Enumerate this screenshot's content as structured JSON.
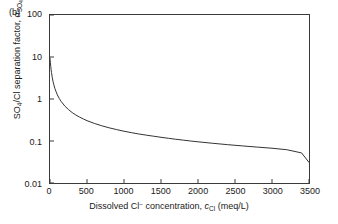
{
  "figure": {
    "panel_label": "(b)",
    "line_color": "#333333",
    "axis_color": "#3a3a3a",
    "background_color": "#ffffff"
  },
  "axis_titles": {
    "y_prefix": "SO",
    "y_sub1": "4",
    "y_mid": "/Cl separation factor, ",
    "y_alpha": "α",
    "y_alpha_sub": "SO4/Cl",
    "x_prefix": "Dissolved Cl",
    "x_sup": "−",
    "x_mid": " concentration, ",
    "x_c": "c",
    "x_c_sub": "Cl",
    "x_units": " (meq/L)"
  },
  "chart_data": {
    "type": "line",
    "title": "",
    "subtitle": "",
    "xlabel": "Dissolved Cl− concentration, cCl (meq/L)",
    "ylabel": "SO4/Cl separation factor, αSO4/Cl",
    "xlim": [
      0,
      3500
    ],
    "ylim": [
      0.01,
      100
    ],
    "yscale": "log",
    "xscale": "linear",
    "grid": false,
    "legend": null,
    "xticks": [
      0,
      500,
      1000,
      1500,
      2000,
      2500,
      3000,
      3500
    ],
    "xticklabels": [
      "0",
      "500",
      "1000",
      "1500",
      "2000",
      "2500",
      "3000",
      "3500"
    ],
    "yticks": [
      0.01,
      0.1,
      1,
      10,
      100
    ],
    "yticklabels": [
      "0.01",
      "0.1",
      "1",
      "10",
      "100"
    ],
    "series": [
      {
        "name": "SO4/Cl separation factor",
        "x": [
          0,
          2,
          5,
          10,
          15,
          20,
          30,
          40,
          50,
          65,
          80,
          100,
          125,
          150,
          200,
          250,
          300,
          350,
          400,
          450,
          500,
          600,
          700,
          800,
          900,
          1000,
          1100,
          1200,
          1300,
          1400,
          1500,
          1600,
          1700,
          1800,
          1900,
          2000,
          2200,
          2400,
          2600,
          2800,
          3000,
          3200,
          3400,
          3500
        ],
        "y": [
          9.5,
          8.6,
          7.4,
          6.0,
          5.0,
          4.3,
          3.3,
          2.65,
          2.25,
          1.8,
          1.52,
          1.25,
          1.03,
          0.88,
          0.68,
          0.56,
          0.475,
          0.415,
          0.37,
          0.335,
          0.305,
          0.262,
          0.23,
          0.206,
          0.187,
          0.171,
          0.158,
          0.147,
          0.138,
          0.13,
          0.1225,
          0.116,
          0.11,
          0.1048,
          0.1,
          0.0957,
          0.0882,
          0.0818,
          0.0764,
          0.0716,
          0.0673,
          0.062,
          0.052,
          0.031
        ]
      }
    ],
    "annotations": [
      {
        "text": "(b)",
        "position": "top-left-outside"
      }
    ]
  }
}
